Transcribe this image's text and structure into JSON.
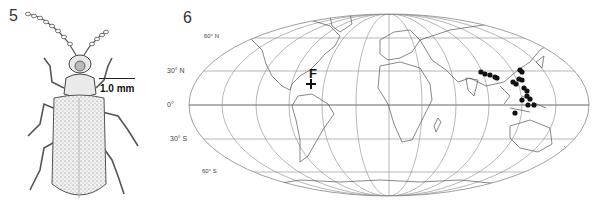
{
  "figure5": {
    "number": "5",
    "subject": "beetle habitus illustration (dorsal view)",
    "scale_bar_label": "1.0 mm"
  },
  "figure6": {
    "number": "6",
    "subject": "world distribution map",
    "latitude_labels": [
      "60° N",
      "30° N",
      "0°",
      "30° S",
      "60° S"
    ],
    "marker_label": "F",
    "colors": {
      "grid": "#888888",
      "coast": "#555555",
      "points": "#111111"
    },
    "distribution_points": [
      {
        "x": 481,
        "y": 72
      },
      {
        "x": 485,
        "y": 74
      },
      {
        "x": 490,
        "y": 75
      },
      {
        "x": 495,
        "y": 77
      },
      {
        "x": 497,
        "y": 78
      },
      {
        "x": 513,
        "y": 82
      },
      {
        "x": 516,
        "y": 84
      },
      {
        "x": 520,
        "y": 70
      },
      {
        "x": 522,
        "y": 72
      },
      {
        "x": 519,
        "y": 79
      },
      {
        "x": 522,
        "y": 80
      },
      {
        "x": 524,
        "y": 88
      },
      {
        "x": 527,
        "y": 91
      },
      {
        "x": 522,
        "y": 100
      },
      {
        "x": 527,
        "y": 96
      },
      {
        "x": 530,
        "y": 99
      },
      {
        "x": 528,
        "y": 105
      },
      {
        "x": 515,
        "y": 113
      },
      {
        "x": 534,
        "y": 105
      }
    ],
    "cross_marker": {
      "x": 311,
      "y": 84
    }
  }
}
